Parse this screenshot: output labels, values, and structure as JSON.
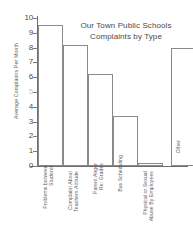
{
  "chart_data": {
    "type": "bar",
    "title": "Our Town Public Schools Complaints by Type",
    "title_lines": [
      "Our Town Public Schools",
      "Complaints by Type"
    ],
    "xlabel": "",
    "ylabel": "Average Complaints Per Month",
    "ylim": [
      0,
      10
    ],
    "yticks": [
      "0",
      "1",
      "2",
      "3",
      "4",
      "5",
      "6",
      "7",
      "8",
      "9",
      "10"
    ],
    "grid": false,
    "legend": false,
    "categories": [
      "Problems between Students",
      "Complaint About Teachers Attitude",
      "Parent Anger Re: Grades",
      "Bus Scheduling",
      "Physical or Sexual Abuse By Employees",
      "Other"
    ],
    "category_lines": [
      [
        "Problems between",
        "Students"
      ],
      [
        "Complaint About",
        "Teachers Attitude"
      ],
      [
        "Parent Anger",
        "Re: Grades"
      ],
      [
        "Bus Scheduling"
      ],
      [
        "Physical or Sexual",
        "Abuse By Employees"
      ],
      [
        "Other"
      ]
    ],
    "values": [
      9.5,
      8.2,
      6.2,
      3.4,
      0.2,
      7.95
    ],
    "bar_color": "#ffffff",
    "bar_edge_color": "#8a8a8a",
    "axis_color": "#6e6e6e",
    "text_color": "#555555"
  }
}
